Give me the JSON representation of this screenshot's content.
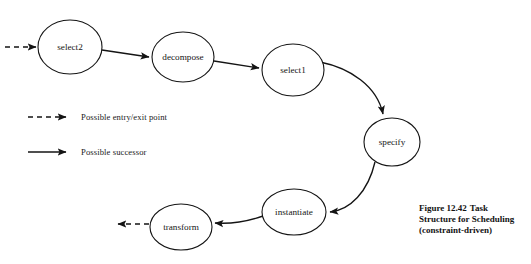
{
  "figure": {
    "caption_number": "Figure 12.42",
    "caption_text": "Task Structure for Scheduling (constraint-driven)"
  },
  "diagram": {
    "type": "directed-graph",
    "background_color": "#ffffff",
    "stroke_color": "#141414",
    "nodes": [
      {
        "id": "select2",
        "label": "select2",
        "cx": 70,
        "cy": 47,
        "rx": 32,
        "ry": 27
      },
      {
        "id": "decompose",
        "label": "decompose",
        "cx": 183,
        "cy": 57,
        "rx": 31,
        "ry": 25
      },
      {
        "id": "select1",
        "label": "select1",
        "cx": 293,
        "cy": 70,
        "rx": 31,
        "ry": 26
      },
      {
        "id": "specify",
        "label": "specify",
        "cx": 392,
        "cy": 142,
        "rx": 28,
        "ry": 24
      },
      {
        "id": "instantiate",
        "label": "instantiate",
        "cx": 294,
        "cy": 212,
        "rx": 32,
        "ry": 23
      },
      {
        "id": "transform",
        "label": "transform",
        "cx": 181,
        "cy": 227,
        "rx": 31,
        "ry": 23
      }
    ],
    "edges": [
      {
        "from": "entry",
        "to": "select2",
        "style": "dashed",
        "kind": "entry-point"
      },
      {
        "from": "select2",
        "to": "decompose",
        "style": "solid",
        "kind": "successor"
      },
      {
        "from": "decompose",
        "to": "select1",
        "style": "solid",
        "kind": "successor"
      },
      {
        "from": "select1",
        "to": "specify",
        "style": "solid",
        "kind": "successor"
      },
      {
        "from": "specify",
        "to": "instantiate",
        "style": "solid",
        "kind": "successor"
      },
      {
        "from": "instantiate",
        "to": "transform",
        "style": "solid",
        "kind": "successor"
      },
      {
        "from": "transform",
        "to": "exit",
        "style": "dashed",
        "kind": "exit-point"
      }
    ]
  },
  "legend": {
    "entry_exit_label": "Possible entry/exit point",
    "successor_label": "Possible successor"
  }
}
